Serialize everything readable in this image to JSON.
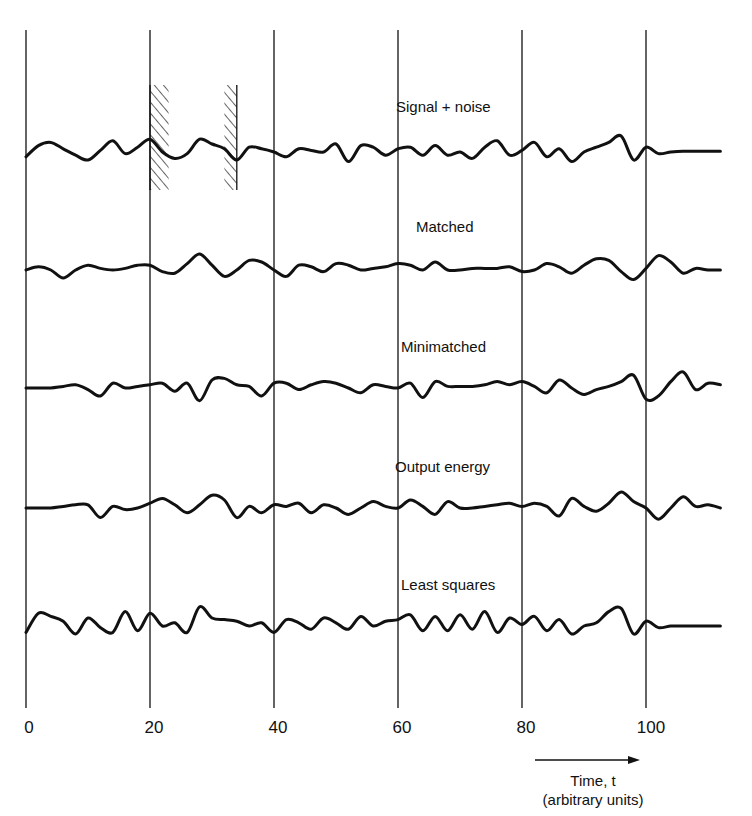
{
  "chart_data": {
    "type": "line",
    "title": "",
    "xlabel": "Time, t",
    "xlabel_sub": "(arbitrary units)",
    "ylabel": "",
    "xlim": [
      0,
      113
    ],
    "x_ticks": [
      0,
      20,
      40,
      60,
      80,
      100
    ],
    "tick_labels": [
      "0",
      "20",
      "40",
      "60",
      "80",
      "100"
    ],
    "grid": "vertical lines at each x tick",
    "legend": "none (each trace labeled inline)",
    "hatched_regions": [
      {
        "x_start": 20,
        "x_end": 23,
        "trace": "Signal + noise"
      },
      {
        "x_start": 32,
        "x_end": 34,
        "trace": "Signal + noise"
      }
    ],
    "x": [
      0,
      2,
      4,
      6,
      8,
      10,
      12,
      14,
      16,
      18,
      20,
      22,
      24,
      26,
      28,
      30,
      32,
      34,
      36,
      38,
      40,
      42,
      44,
      46,
      48,
      50,
      52,
      54,
      56,
      58,
      60,
      62,
      64,
      66,
      68,
      70,
      72,
      74,
      76,
      78,
      80,
      82,
      84,
      86,
      88,
      90,
      92,
      94,
      96,
      98,
      100,
      102,
      104,
      106,
      108,
      110,
      112
    ],
    "series": [
      {
        "name": "Signal + noise",
        "values": [
          -0.3,
          0.4,
          0.6,
          0.2,
          -0.2,
          -0.5,
          0.1,
          0.7,
          -0.1,
          0.3,
          0.8,
          0.0,
          -0.4,
          -0.1,
          0.8,
          0.5,
          0.2,
          -0.5,
          0.3,
          0.2,
          0.0,
          -0.3,
          0.2,
          0.1,
          0.0,
          0.5,
          -0.6,
          0.4,
          0.3,
          -0.2,
          0.2,
          0.3,
          -0.2,
          0.4,
          -0.2,
          0.0,
          -0.4,
          0.3,
          0.7,
          -0.2,
          0.1,
          0.6,
          -0.3,
          0.2,
          -0.6,
          0.0,
          0.3,
          0.6,
          1.0,
          -0.5,
          0.3,
          -0.1,
          0.0,
          0.05,
          0.05,
          0.05,
          0.05
        ]
      },
      {
        "name": "Matched",
        "values": [
          0.0,
          0.2,
          0.0,
          -0.5,
          0.0,
          0.3,
          0.1,
          0.0,
          0.1,
          0.3,
          0.3,
          -0.1,
          -0.2,
          0.4,
          1.0,
          0.3,
          -0.4,
          0.0,
          0.6,
          0.5,
          0.0,
          -0.4,
          0.3,
          0.2,
          -0.1,
          0.4,
          0.3,
          0.0,
          0.1,
          0.2,
          0.4,
          0.3,
          0.0,
          0.5,
          0.0,
          0.0,
          0.1,
          0.1,
          0.1,
          0.2,
          -0.1,
          0.0,
          0.4,
          0.2,
          -0.2,
          0.3,
          0.7,
          0.6,
          -0.1,
          -0.6,
          0.1,
          0.9,
          0.5,
          -0.2,
          0.1,
          0.0,
          0.0
        ]
      },
      {
        "name": "Minimatched",
        "values": [
          0.0,
          0.0,
          0.0,
          0.1,
          0.2,
          -0.1,
          -0.5,
          0.3,
          0.0,
          0.1,
          0.2,
          0.3,
          -0.2,
          0.3,
          -0.8,
          0.5,
          0.6,
          0.2,
          0.1,
          -0.5,
          0.3,
          0.3,
          -0.1,
          0.2,
          0.4,
          0.3,
          0.0,
          -0.3,
          0.2,
          0.1,
          0.0,
          0.3,
          -0.6,
          0.4,
          0.1,
          0.1,
          0.1,
          0.2,
          0.4,
          0.2,
          0.4,
          0.1,
          -0.3,
          0.5,
          0.0,
          -0.4,
          -0.1,
          0.1,
          0.4,
          0.8,
          -0.7,
          -0.5,
          0.4,
          1.0,
          -0.1,
          0.3,
          0.2
        ]
      },
      {
        "name": "Output energy",
        "values": [
          0.0,
          0.0,
          0.0,
          0.1,
          0.2,
          0.2,
          -0.6,
          0.1,
          -0.1,
          0.0,
          0.3,
          0.6,
          0.2,
          -0.3,
          0.2,
          0.8,
          0.5,
          -0.6,
          0.1,
          -0.3,
          0.2,
          0.1,
          0.3,
          -0.3,
          0.2,
          0.0,
          -0.4,
          0.0,
          0.4,
          0.1,
          0.0,
          0.5,
          0.1,
          -0.4,
          0.4,
          0.0,
          0.0,
          0.1,
          0.2,
          0.3,
          0.1,
          0.3,
          0.1,
          -0.5,
          0.6,
          0.1,
          -0.2,
          0.3,
          1.0,
          0.4,
          0.0,
          -0.7,
          0.0,
          0.7,
          0.1,
          0.2,
          0.0
        ]
      },
      {
        "name": "Least squares",
        "values": [
          -0.4,
          0.8,
          0.6,
          0.3,
          -0.5,
          0.5,
          -0.1,
          -0.4,
          0.9,
          -0.3,
          0.8,
          0.0,
          0.2,
          -0.4,
          1.2,
          0.5,
          0.4,
          0.3,
          0.0,
          0.2,
          -0.4,
          0.4,
          0.2,
          -0.2,
          0.5,
          0.2,
          -0.2,
          0.6,
          0.0,
          0.3,
          0.4,
          0.7,
          -0.3,
          0.6,
          -0.3,
          0.7,
          -0.2,
          0.9,
          -0.4,
          0.5,
          0.1,
          0.6,
          -0.3,
          0.4,
          -0.5,
          0.0,
          0.2,
          0.9,
          1.1,
          -0.5,
          0.3,
          -0.1,
          0.0,
          0.0,
          0.0,
          0.0,
          0.0
        ]
      }
    ]
  },
  "labels": {
    "trace_1": "Signal + noise",
    "trace_2": "Matched",
    "trace_3": "Minimatched",
    "trace_4": "Output energy",
    "trace_5": "Least squares"
  },
  "axis": {
    "ticks": [
      "0",
      "20",
      "40",
      "60",
      "80",
      "100"
    ],
    "caption_line1": "Time, t",
    "caption_line2": "(arbitrary units)"
  },
  "colors": {
    "ink": "#111111",
    "background": "#ffffff"
  }
}
